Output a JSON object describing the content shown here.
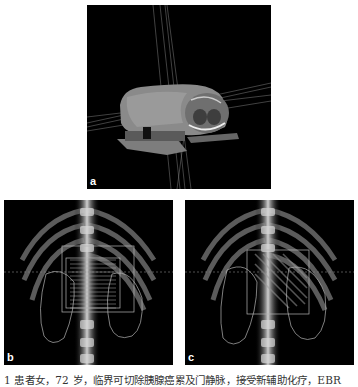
{
  "figure": {
    "panels": [
      {
        "id": "a",
        "label": "a",
        "content": "3D volume rendering of patient torso with radiation beam lines"
      },
      {
        "id": "b",
        "label": "b",
        "content": "Coronal DRR of abdomen with tumor target contours and striped beam overlay"
      },
      {
        "id": "c",
        "label": "c",
        "content": "Coronal DRR of abdomen with tumor target contours and diagonal beam overlay"
      }
    ],
    "caption": "1   患者女，72 岁，临界可切除胰腺癌累及门静脉，接受新辅助化疗，EBR"
  }
}
